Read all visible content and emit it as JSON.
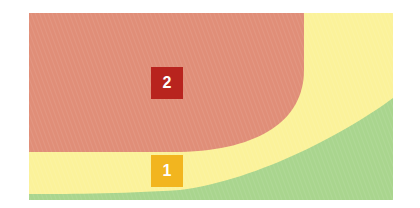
{
  "diagram": {
    "zones": [
      {
        "id": "green",
        "color": "#A9D58E"
      },
      {
        "id": "yellow",
        "color": "#FBF29A"
      },
      {
        "id": "red",
        "color": "#E08E78"
      }
    ],
    "badges": [
      {
        "label": "2",
        "color": "#B8241E"
      },
      {
        "label": "1",
        "color": "#F2B51F"
      }
    ]
  }
}
